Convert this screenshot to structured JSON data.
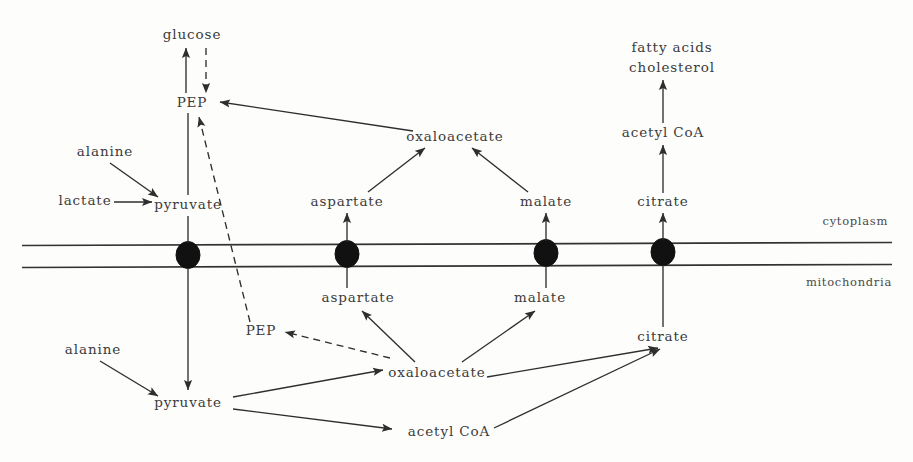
{
  "figure": {
    "type": "metabolic-pathway-diagram",
    "background_color": "#fdfdfc",
    "line_color": "#2e2e2e",
    "text_color": "#3b3b3b"
  },
  "compartments": {
    "upper_label": "cytoplasm",
    "lower_label": "mitochondria",
    "membrane": {
      "top_line_y": 244,
      "bottom_line_y": 265,
      "transporter_count": 4
    }
  },
  "nodes": {
    "glucose": {
      "label": "glucose",
      "x": 192,
      "y": 35,
      "compartment": "cytoplasm"
    },
    "pep_cyto": {
      "label": "PEP",
      "x": 192,
      "y": 103,
      "compartment": "cytoplasm"
    },
    "alanine_cyto": {
      "label": "alanine",
      "x": 105,
      "y": 152,
      "compartment": "cytoplasm"
    },
    "lactate": {
      "label": "lactate",
      "x": 85,
      "y": 201,
      "compartment": "cytoplasm"
    },
    "pyruvate_cyto": {
      "label": "pyruvate",
      "x": 188,
      "y": 205,
      "compartment": "cytoplasm"
    },
    "oxaloacetate_cyto": {
      "label": "oxaloacetate",
      "x": 455,
      "y": 137,
      "compartment": "cytoplasm"
    },
    "aspartate_cyto": {
      "label": "aspartate",
      "x": 347,
      "y": 202,
      "compartment": "cytoplasm"
    },
    "malate_cyto": {
      "label": "malate",
      "x": 546,
      "y": 202,
      "compartment": "cytoplasm"
    },
    "citrate_cyto": {
      "label": "citrate",
      "x": 663,
      "y": 202,
      "compartment": "cytoplasm"
    },
    "acetyl_coa_cyto": {
      "label": "acetyl CoA",
      "x": 663,
      "y": 133,
      "compartment": "cytoplasm"
    },
    "fatty_acids": {
      "label": "fatty acids",
      "x": 672,
      "y": 48,
      "compartment": "cytoplasm"
    },
    "cholesterol": {
      "label": "cholesterol",
      "x": 672,
      "y": 68,
      "compartment": "cytoplasm"
    },
    "pep_mito": {
      "label": "PEP",
      "x": 261,
      "y": 331,
      "compartment": "mitochondria"
    },
    "alanine_mito": {
      "label": "alanine",
      "x": 93,
      "y": 350,
      "compartment": "mitochondria"
    },
    "pyruvate_mito": {
      "label": "pyruvate",
      "x": 188,
      "y": 403,
      "compartment": "mitochondria"
    },
    "oxaloacetate_mito": {
      "label": "oxaloacetate",
      "x": 437,
      "y": 373,
      "compartment": "mitochondria"
    },
    "aspartate_mito": {
      "label": "aspartate",
      "x": 358,
      "y": 298,
      "compartment": "mitochondria"
    },
    "malate_mito": {
      "label": "malate",
      "x": 540,
      "y": 298,
      "compartment": "mitochondria"
    },
    "citrate_mito": {
      "label": "citrate",
      "x": 663,
      "y": 337,
      "compartment": "mitochondria"
    },
    "acetyl_coa_mito": {
      "label": "acetyl CoA",
      "x": 449,
      "y": 432,
      "compartment": "mitochondria"
    }
  },
  "edges": [
    {
      "from": "pep_cyto",
      "to": "glucose",
      "style": "solid",
      "arrow": true
    },
    {
      "from": "glucose",
      "to": "pep_cyto",
      "style": "dashed",
      "arrow": true
    },
    {
      "from": "pyruvate_cyto",
      "to": "pep_cyto",
      "style": "solid",
      "arrow": false
    },
    {
      "from": "alanine_cyto",
      "to": "pyruvate_cyto",
      "style": "solid",
      "arrow": true
    },
    {
      "from": "lactate",
      "to": "pyruvate_cyto",
      "style": "solid",
      "arrow": true
    },
    {
      "from": "oxaloacetate_cyto",
      "to": "pep_cyto",
      "style": "solid",
      "arrow": true
    },
    {
      "from": "aspartate_cyto",
      "to": "oxaloacetate_cyto",
      "style": "solid",
      "arrow": true
    },
    {
      "from": "malate_cyto",
      "to": "oxaloacetate_cyto",
      "style": "solid",
      "arrow": true
    },
    {
      "from": "citrate_cyto",
      "to": "acetyl_coa_cyto",
      "style": "solid",
      "arrow": true
    },
    {
      "from": "acetyl_coa_cyto",
      "to": "fatty_acids",
      "style": "solid",
      "arrow": true
    },
    {
      "from": "pep_mito",
      "to": "pep_cyto",
      "style": "dashed",
      "arrow": true
    },
    {
      "from": "oxaloacetate_mito",
      "to": "pep_mito",
      "style": "dashed",
      "arrow": true
    },
    {
      "from": "alanine_mito",
      "to": "pyruvate_mito",
      "style": "solid",
      "arrow": true
    },
    {
      "from": "pyruvate_cyto",
      "to": "pyruvate_mito",
      "style": "solid",
      "arrow": true
    },
    {
      "from": "pyruvate_mito",
      "to": "oxaloacetate_mito",
      "style": "solid",
      "arrow": true
    },
    {
      "from": "pyruvate_mito",
      "to": "acetyl_coa_mito",
      "style": "solid",
      "arrow": true
    },
    {
      "from": "oxaloacetate_mito",
      "to": "aspartate_mito",
      "style": "solid",
      "arrow": true
    },
    {
      "from": "oxaloacetate_mito",
      "to": "malate_mito",
      "style": "solid",
      "arrow": true
    },
    {
      "from": "oxaloacetate_mito",
      "to": "citrate_mito",
      "style": "solid",
      "arrow": true
    },
    {
      "from": "acetyl_coa_mito",
      "to": "citrate_mito",
      "style": "solid",
      "arrow": true
    },
    {
      "from": "aspartate_mito",
      "to": "aspartate_cyto",
      "style": "solid",
      "arrow": false
    },
    {
      "from": "malate_mito",
      "to": "malate_cyto",
      "style": "solid",
      "arrow": false
    },
    {
      "from": "citrate_mito",
      "to": "citrate_cyto",
      "style": "solid",
      "arrow": false
    }
  ]
}
